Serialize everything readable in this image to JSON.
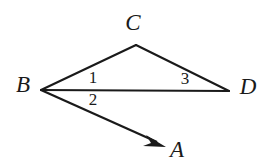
{
  "figure": {
    "type": "geometry-diagram",
    "background_color": "#ffffff",
    "stroke_color": "#1a1a1a",
    "width": 273,
    "height": 167
  },
  "points": {
    "A": {
      "label": "A",
      "label_x": 177,
      "label_y": 152,
      "x": 165,
      "y": 146
    },
    "B": {
      "label": "B",
      "label_x": 23,
      "label_y": 87,
      "x": 41,
      "y": 90
    },
    "C": {
      "label": "C",
      "label_x": 133,
      "label_y": 25,
      "x": 136,
      "y": 45
    },
    "D": {
      "label": "D",
      "label_x": 248,
      "label_y": 89,
      "x": 229,
      "y": 91
    }
  },
  "segments": [
    {
      "name": "segment-BC",
      "from": "B",
      "to": "C",
      "x1": 41,
      "y1": 90,
      "x2": 136,
      "y2": 45
    },
    {
      "name": "segment-CD",
      "from": "C",
      "to": "D",
      "x1": 136,
      "y1": 45,
      "x2": 229,
      "y2": 91
    },
    {
      "name": "segment-BD",
      "from": "B",
      "to": "D",
      "x1": 41,
      "y1": 90,
      "x2": 229,
      "y2": 91
    }
  ],
  "rays": [
    {
      "name": "ray-BA",
      "from": "B",
      "to": "A",
      "x1": 41,
      "y1": 90,
      "x2": 165,
      "y2": 146,
      "arrow_at": "A"
    }
  ],
  "angle_labels": [
    {
      "name": "angle-1",
      "text": "1",
      "x": 93,
      "y": 79,
      "at_vertex": "B",
      "position": "above-BD"
    },
    {
      "name": "angle-2",
      "text": "2",
      "x": 93,
      "y": 101,
      "at_vertex": "B",
      "position": "below-BD"
    },
    {
      "name": "angle-3",
      "text": "3",
      "x": 185,
      "y": 80,
      "at_vertex": "D",
      "position": "above-BD"
    }
  ]
}
